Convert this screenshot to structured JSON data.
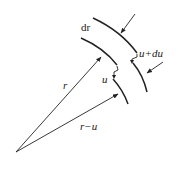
{
  "diagram": {
    "type": "annular-element-displacement",
    "colors": {
      "stroke": "#222222",
      "background": "#ffffff"
    },
    "labels": {
      "dr": "dr",
      "u_plus_du": "u+du",
      "u": "u",
      "r": "r",
      "r_minus_u": "r−u"
    }
  }
}
